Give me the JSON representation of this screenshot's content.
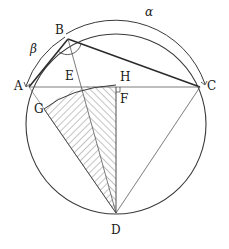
{
  "diagram": {
    "type": "geometry",
    "colors": {
      "stroke": "#3a3a3a",
      "hatch": "#6a6a6a",
      "background": "#ffffff"
    },
    "circle": {
      "cx": 116,
      "cy": 124,
      "r": 90
    },
    "points": {
      "A": {
        "x": 29,
        "y": 87,
        "label": "A"
      },
      "B": {
        "x": 68,
        "y": 39,
        "label": "B"
      },
      "C": {
        "x": 200,
        "y": 87,
        "label": "C"
      },
      "D": {
        "x": 116,
        "y": 213,
        "label": "D"
      },
      "E": {
        "x": 81,
        "y": 87,
        "label": "E"
      },
      "F": {
        "x": 116,
        "y": 97,
        "label": "F"
      },
      "G": {
        "x": 44,
        "y": 109,
        "label": "G"
      },
      "H": {
        "x": 116,
        "y": 87,
        "label": "H"
      }
    },
    "arcs": {
      "alpha": {
        "label": "α",
        "from": "B",
        "to": "C"
      },
      "beta": {
        "label": "β",
        "from": "A",
        "to": "B"
      }
    },
    "segments": [
      "AB",
      "BC",
      "AC",
      "BD",
      "CD",
      "AD",
      "HD",
      "GD"
    ]
  }
}
